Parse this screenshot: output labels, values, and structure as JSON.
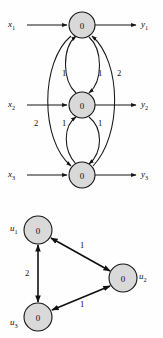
{
  "figure": {
    "background_color": "#fefefe",
    "node_fill_color": "#d9d9d9",
    "node_stroke_color": "#141414",
    "edge_color": "#141414"
  },
  "top_graph": {
    "name": "input-output-network",
    "nodes": [
      {
        "id": "n1",
        "value": "0",
        "cx": 82,
        "cy": 25,
        "r": 13
      },
      {
        "id": "n2",
        "value": "0",
        "cx": 82,
        "cy": 105,
        "r": 13
      },
      {
        "id": "n3",
        "value": "0",
        "cx": 82,
        "cy": 175,
        "r": 13
      }
    ],
    "inputs": [
      {
        "base": "x",
        "sub": "1",
        "x": 12,
        "y": 25
      },
      {
        "base": "x",
        "sub": "2",
        "x": 12,
        "y": 105
      },
      {
        "base": "x",
        "sub": "3",
        "x": 12,
        "y": 175
      }
    ],
    "outputs": [
      {
        "base": "y",
        "sub": "1",
        "x": 143,
        "y": 25
      },
      {
        "base": "y",
        "sub": "2",
        "x": 143,
        "y": 105
      },
      {
        "base": "y",
        "sub": "3",
        "x": 143,
        "y": 175
      }
    ],
    "edge_weights": [
      {
        "id": "w-n2-n1-left",
        "value": "1",
        "x": 64,
        "y": 73
      },
      {
        "id": "w-n1-n2-right",
        "value": "1",
        "x": 100,
        "y": 73
      },
      {
        "id": "w-n3-n1-outer-right",
        "value": "2",
        "x": 119,
        "y": 73
      },
      {
        "id": "w-n3-n1-outer-left",
        "value": "2",
        "x": 36,
        "y": 123
      },
      {
        "id": "w-n3-n2-left",
        "value": "1",
        "x": 64,
        "y": 123
      },
      {
        "id": "w-n2-n3-right",
        "value": "1",
        "x": 100,
        "y": 123
      }
    ]
  },
  "bottom_graph": {
    "name": "three-node-cycle",
    "nodes": [
      {
        "id": "u1",
        "value": "0",
        "cx": 38,
        "cy": 230,
        "r": 14,
        "label": "u",
        "sub": "1",
        "label_x": 14,
        "label_y": 228
      },
      {
        "id": "u2",
        "value": "0",
        "cx": 123,
        "cy": 278,
        "r": 14,
        "label": "u",
        "sub": "2",
        "label_x": 141,
        "label_y": 276
      },
      {
        "id": "u3",
        "value": "0",
        "cx": 38,
        "cy": 317,
        "r": 14,
        "label": "u",
        "sub": "3",
        "label_x": 14,
        "label_y": 322
      }
    ],
    "edge_weights": [
      {
        "id": "w-u1-u2",
        "value": "1",
        "x": 82,
        "y": 245
      },
      {
        "id": "w-u1-u3",
        "value": "2",
        "x": 27,
        "y": 273
      },
      {
        "id": "w-u3-u2",
        "value": "1",
        "x": 82,
        "y": 304
      }
    ]
  }
}
